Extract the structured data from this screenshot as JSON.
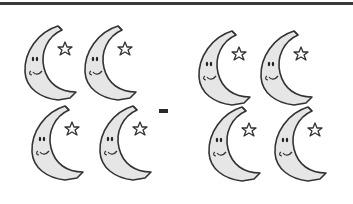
{
  "worksheet": {
    "operation_symbol": "-",
    "left_group": {
      "count": 4,
      "icon": "crescent-moon-with-star-icon"
    },
    "right_group": {
      "count": 4,
      "icon": "crescent-moon-with-star-icon"
    }
  },
  "colors": {
    "rule": "#3a3a3a",
    "moon_fill": "#e6e6e6",
    "moon_stroke": "#333333",
    "background": "#ffffff"
  }
}
